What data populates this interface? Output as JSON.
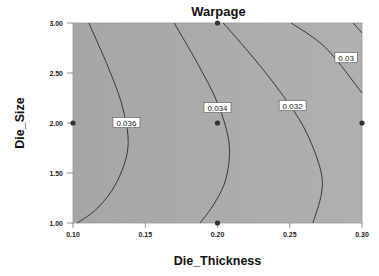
{
  "chart_data": {
    "type": "contour",
    "title": "Warpage",
    "xlabel": "Die_Thickness",
    "ylabel": "Die_Size",
    "xlim": [
      0.1,
      0.3
    ],
    "ylim": [
      1.0,
      3.0
    ],
    "x_ticks": [
      "0.10",
      "0.15",
      "0.20",
      "0.25",
      "0.30"
    ],
    "y_ticks": [
      "1.00",
      "1.50",
      "2.00",
      "2.50",
      "3.00"
    ],
    "grid": false,
    "legend": "none",
    "colors": {
      "plot_bg": "#a9a9a9",
      "line": "#2a2a2a",
      "point": "#333333"
    },
    "contours": [
      {
        "level": "0.036",
        "label_pos": [
          0.137,
          2.0
        ],
        "points": [
          [
            0.111,
            3.0
          ],
          [
            0.126,
            2.5
          ],
          [
            0.135,
            2.12
          ],
          [
            0.138,
            1.75
          ],
          [
            0.13,
            1.4
          ],
          [
            0.117,
            1.15
          ],
          [
            0.103,
            1.0
          ]
        ]
      },
      {
        "level": "0.034",
        "label_pos": [
          0.2,
          2.15
        ],
        "points": [
          [
            0.17,
            3.0
          ],
          [
            0.186,
            2.6
          ],
          [
            0.2,
            2.2
          ],
          [
            0.208,
            1.8
          ],
          [
            0.206,
            1.45
          ],
          [
            0.198,
            1.2
          ],
          [
            0.188,
            1.0
          ]
        ]
      },
      {
        "level": "0.032",
        "label_pos": [
          0.252,
          2.17
        ],
        "points": [
          [
            0.204,
            3.0
          ],
          [
            0.225,
            2.65
          ],
          [
            0.244,
            2.3
          ],
          [
            0.26,
            1.95
          ],
          [
            0.271,
            1.55
          ],
          [
            0.272,
            1.3
          ],
          [
            0.266,
            1.0
          ]
        ]
      },
      {
        "level": "0.03",
        "label_pos": [
          0.289,
          2.65
        ],
        "points": [
          [
            0.251,
            3.0
          ],
          [
            0.275,
            2.75
          ],
          [
            0.3,
            2.3
          ]
        ]
      },
      {
        "level": "",
        "label_pos": null,
        "points": [
          [
            0.294,
            3.0
          ],
          [
            0.3,
            2.9
          ]
        ]
      }
    ],
    "design_points": [
      [
        0.1,
        2.0
      ],
      [
        0.2,
        3.0
      ],
      [
        0.2,
        2.0
      ],
      [
        0.2,
        1.0
      ],
      [
        0.3,
        2.0
      ]
    ]
  }
}
